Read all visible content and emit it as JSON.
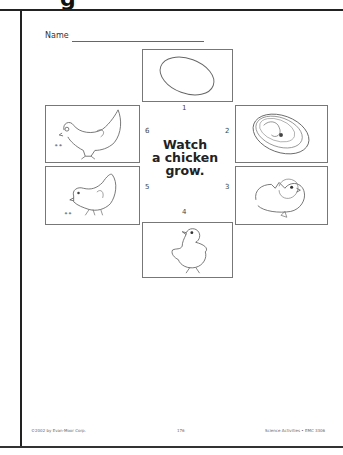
{
  "page": {
    "heading_partial": "g"
  },
  "worksheet": {
    "name_label": "Name",
    "title": {
      "line1": "Watch",
      "line2": "a chicken",
      "line3": "grow."
    },
    "panels": [
      {
        "number": "1",
        "icon": "egg-icon",
        "description": "egg"
      },
      {
        "number": "2",
        "icon": "embryo-icon",
        "description": "chick embryo inside egg"
      },
      {
        "number": "3",
        "icon": "hatching-chick-icon",
        "description": "chick hatching from egg"
      },
      {
        "number": "4",
        "icon": "baby-chick-icon",
        "description": "baby chick"
      },
      {
        "number": "5",
        "icon": "young-chicken-icon",
        "description": "young chicken pecking"
      },
      {
        "number": "6",
        "icon": "hen-icon",
        "description": "adult hen pecking"
      }
    ]
  },
  "footer": {
    "copyright": "©2002 by Evan-Moor Corp.",
    "page_number": "176",
    "series": "Science Activities • EMC 3306"
  }
}
